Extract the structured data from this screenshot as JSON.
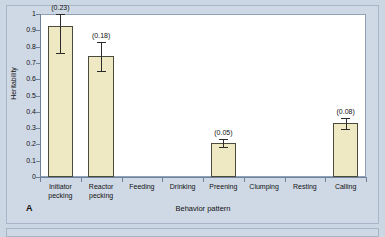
{
  "figure": {
    "panel_letter": "A",
    "background_color": "#cfd9e6",
    "plot_background_color": "#ffffff",
    "bar_fill_color": "#efe9c3",
    "bar_border_color": "#4b4b3d",
    "axis_color": "#6f8299"
  },
  "chart_data": {
    "type": "bar",
    "title": "",
    "xlabel": "Behavior pattern",
    "ylabel": "Heritability",
    "ylim": [
      0,
      1
    ],
    "grid": false,
    "legend": "none",
    "categories": [
      "Initiator pecking",
      "Reactor pecking",
      "Feeding",
      "Drinking",
      "Preening",
      "Clumping",
      "Resting",
      "Calling"
    ],
    "category_lines": [
      [
        "Initiator",
        "pecking"
      ],
      [
        "Reactor",
        "pecking"
      ],
      [
        "Feeding"
      ],
      [
        "Drinking"
      ],
      [
        "Preening"
      ],
      [
        "Clumping"
      ],
      [
        "Resting"
      ],
      [
        "Calling"
      ]
    ],
    "values": [
      0.925,
      0.74,
      0,
      0,
      0.21,
      0,
      0,
      0.33
    ],
    "errors": [
      0.165,
      0.09,
      0,
      0,
      0.025,
      0,
      0,
      0.035
    ],
    "value_labels": [
      "(0.23)",
      "(0.18)",
      "",
      "",
      "(0.05)",
      "",
      "",
      "(0.08)"
    ],
    "ytick_labels": [
      "1",
      "0.9",
      "0.8",
      "0.7",
      "0.6",
      "0.5",
      "0.4",
      "0.3",
      "0.2",
      "0.1",
      "0"
    ],
    "ytick_values": [
      1,
      0.9,
      0.8,
      0.7,
      0.6,
      0.5,
      0.4,
      0.3,
      0.2,
      0.1,
      0
    ]
  }
}
